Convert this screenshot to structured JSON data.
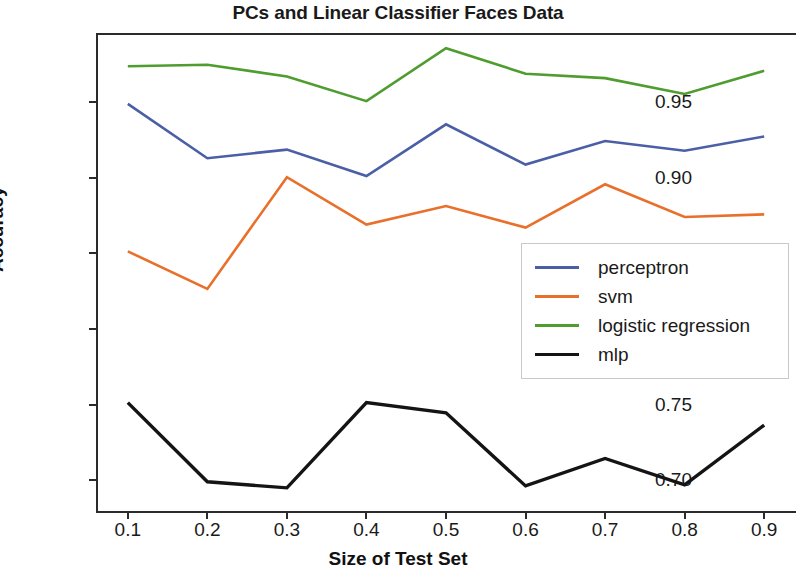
{
  "chart_data": {
    "type": "line",
    "title": "PCs and Linear Classifier Faces Data",
    "xlabel": "Size of Test Set",
    "ylabel": "Accuracy",
    "x": [
      0.1,
      0.2,
      0.3,
      0.4,
      0.5,
      0.6,
      0.7,
      0.8,
      0.9
    ],
    "xticklabels": [
      "0.1",
      "0.2",
      "0.3",
      "0.4",
      "0.5",
      "0.6",
      "0.7",
      "0.8",
      "0.9"
    ],
    "yticklabels": [
      "0.70",
      "0.75",
      "0.80",
      "0.85",
      "0.90",
      "0.95"
    ],
    "yticks": [
      0.7,
      0.75,
      0.8,
      0.85,
      0.9,
      0.95
    ],
    "xlim": [
      0.06,
      0.94
    ],
    "ylim": [
      0.6785,
      0.9955
    ],
    "grid": false,
    "legend_position": "center right",
    "series": [
      {
        "name": "perceptron",
        "color": "#4a5fa5",
        "values": [
          0.9487,
          0.9128,
          0.9185,
          0.901,
          0.9352,
          0.9086,
          0.9242,
          0.9177,
          0.9272
        ]
      },
      {
        "name": "svm",
        "color": "#e8702a",
        "values": [
          0.8513,
          0.8265,
          0.9003,
          0.869,
          0.8812,
          0.867,
          0.8956,
          0.874,
          0.8757
        ]
      },
      {
        "name": "logistic regression",
        "color": "#4f9c2f",
        "values": [
          0.9735,
          0.9745,
          0.9668,
          0.9505,
          0.9855,
          0.9686,
          0.9657,
          0.9552,
          0.9705
        ]
      },
      {
        "name": "mlp",
        "color": "#141414",
        "values": [
          0.7514,
          0.6991,
          0.6951,
          0.7514,
          0.7447,
          0.6964,
          0.7145,
          0.6971,
          0.7366
        ]
      }
    ]
  }
}
